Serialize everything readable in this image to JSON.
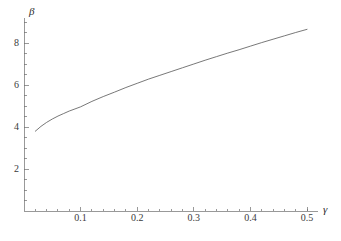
{
  "chart_data": {
    "type": "line",
    "title": "",
    "subtitle": "",
    "xlabel": "γ",
    "ylabel": "β",
    "xlim": [
      0.0,
      0.52
    ],
    "ylim": [
      0.0,
      9.2
    ],
    "grid": false,
    "legend": null,
    "xticks": [
      0.1,
      0.2,
      0.3,
      0.4,
      0.5
    ],
    "xtick_labels": [
      "0.1",
      "0.2",
      "0.3",
      "0.4",
      "0.5"
    ],
    "yticks": [
      2,
      4,
      6,
      8
    ],
    "ytick_labels": [
      "2",
      "4",
      "6",
      "8"
    ],
    "x_minor_ticks": [
      0.02,
      0.04,
      0.06,
      0.08,
      0.12,
      0.14,
      0.16,
      0.18,
      0.22,
      0.24,
      0.26,
      0.28,
      0.32,
      0.34,
      0.36,
      0.38,
      0.42,
      0.44,
      0.46,
      0.48,
      0.5
    ],
    "y_minor_ticks": [
      0.5,
      1.0,
      1.5,
      2.5,
      3.0,
      3.5,
      4.5,
      5.0,
      5.5,
      6.5,
      7.0,
      7.5,
      8.5,
      9.0
    ],
    "series": [
      {
        "name": "beta-vs-gamma",
        "color": "#555555",
        "linewidth": 0.8,
        "x": [
          0.02,
          0.03,
          0.04,
          0.05,
          0.06,
          0.07,
          0.08,
          0.09,
          0.1,
          0.12,
          0.14,
          0.16,
          0.18,
          0.2,
          0.22,
          0.24,
          0.26,
          0.28,
          0.3,
          0.32,
          0.34,
          0.36,
          0.38,
          0.4,
          0.42,
          0.44,
          0.46,
          0.48,
          0.5
        ],
        "y": [
          3.8,
          4.03,
          4.22,
          4.38,
          4.52,
          4.64,
          4.76,
          4.86,
          4.96,
          5.22,
          5.45,
          5.66,
          5.88,
          6.08,
          6.28,
          6.46,
          6.64,
          6.82,
          7.0,
          7.18,
          7.35,
          7.52,
          7.68,
          7.85,
          8.02,
          8.18,
          8.34,
          8.5,
          8.65
        ]
      }
    ]
  },
  "axes": {
    "y_axis_name": "beta-axis",
    "x_axis_name": "gamma-axis"
  }
}
